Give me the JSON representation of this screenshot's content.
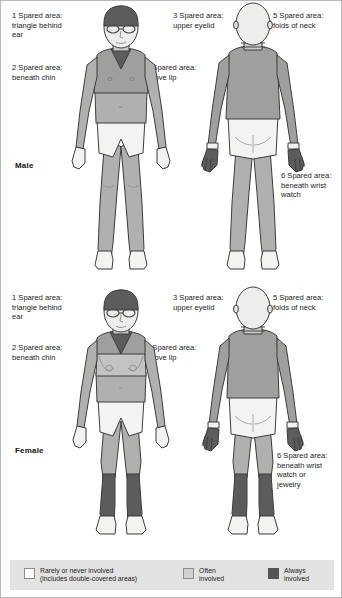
{
  "figure": {
    "sections": [
      {
        "id": "male",
        "sex_label": "Male",
        "views": [
          "front",
          "back"
        ],
        "callouts": [
          {
            "number": "1",
            "text": "1 Spared area:\ntriangle behind\near"
          },
          {
            "number": "2",
            "text": "2 Spared area:\nbeneath chin"
          },
          {
            "number": "3",
            "text": "3 Spared area:\nupper eyelid"
          },
          {
            "number": "4",
            "text": "4 Spared area:\nabove lip"
          },
          {
            "number": "5",
            "text": "5 Spared area:\nfolds of neck"
          },
          {
            "number": "6",
            "text": "6 Spared area:\nbeneath wrist\nwatch"
          }
        ]
      },
      {
        "id": "female",
        "sex_label": "Female",
        "views": [
          "front",
          "back"
        ],
        "callouts": [
          {
            "number": "1",
            "text": "1 Spared area:\ntriangle behind\near"
          },
          {
            "number": "2",
            "text": "2 Spared area:\nbeneath chin"
          },
          {
            "number": "3",
            "text": "3 Spared area:\nupper eyelid"
          },
          {
            "number": "4",
            "text": "4 Spared area:\nabove lip"
          },
          {
            "number": "5",
            "text": "5 Spared area:\nfolds of neck"
          },
          {
            "number": "6",
            "text": "6 Spared area:\nbeneath wrist\nwatch or\njewelry"
          }
        ]
      }
    ]
  },
  "legend": {
    "items": [
      {
        "label": "Rarely or never involved\n(includes double-covered areas)",
        "color": "#ffffff",
        "key": "rarely-never"
      },
      {
        "label": "Often\ninvolved",
        "color": "#d0d0d0",
        "key": "often"
      },
      {
        "label": "Always\ninvolved",
        "color": "#555555",
        "key": "always"
      }
    ],
    "background": "#e2e2e2"
  },
  "colors": {
    "rarely": "#f3f3f1",
    "often": "#c9c9c7",
    "always": "#5c5c5c",
    "mid": "#b0b0ae",
    "outline": "#3d3d3d",
    "page_background": "#ffffff",
    "border": "#b9b9b9"
  }
}
